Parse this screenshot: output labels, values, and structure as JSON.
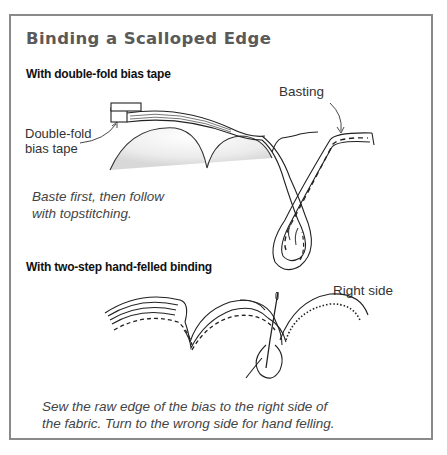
{
  "figure": {
    "title": "Binding a Scalloped Edge",
    "border_color": "#8a8a8a",
    "title_color": "#5a5a5a",
    "sections": [
      {
        "heading": "With double-fold bias tape",
        "labels": {
          "bias_tape_line1": "Double-fold",
          "bias_tape_line2": "bias tape",
          "basting": "Basting"
        },
        "caption_line1": "Baste first, then follow",
        "caption_line2": "with topstitching."
      },
      {
        "heading": "With two-step hand-felled binding",
        "labels": {
          "right_side": "Right side"
        },
        "caption_line1": "Sew the raw edge of the bias to the right side of",
        "caption_line2": "the fabric. Turn to the wrong side for hand felling."
      }
    ]
  }
}
